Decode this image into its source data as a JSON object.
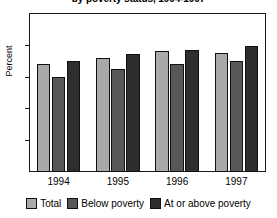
{
  "chart_data": {
    "type": "bar",
    "title": "by poverty status, 1994-1997",
    "xlabel": "",
    "ylabel": "Percent",
    "ylim": [
      0,
      100
    ],
    "yticks": [
      0,
      20,
      40,
      60,
      80,
      100
    ],
    "grid": false,
    "legend_position": "bottom",
    "categories": [
      "1994",
      "1995",
      "1996",
      "1997"
    ],
    "series": [
      {
        "name": "Total",
        "color": "#a9a9a9",
        "values": [
          68,
          72,
          76,
          75
        ]
      },
      {
        "name": "Below poverty",
        "color": "#585858",
        "values": [
          60,
          65,
          68,
          70
        ]
      },
      {
        "name": "At or above poverty",
        "color": "#2e2e2e",
        "values": [
          70,
          74,
          77,
          79
        ]
      }
    ]
  },
  "axis": {
    "y_title": "Percent",
    "y_tick_labels": [
      "100",
      "80",
      "60",
      "40",
      "20",
      "0"
    ],
    "x_tick_labels": [
      "1994",
      "1995",
      "1996",
      "1997"
    ]
  },
  "legend": {
    "items": [
      {
        "label": "Total",
        "color": "#a9a9a9"
      },
      {
        "label": "Below poverty",
        "color": "#585858"
      },
      {
        "label": "At or above poverty",
        "color": "#2e2e2e"
      }
    ]
  }
}
